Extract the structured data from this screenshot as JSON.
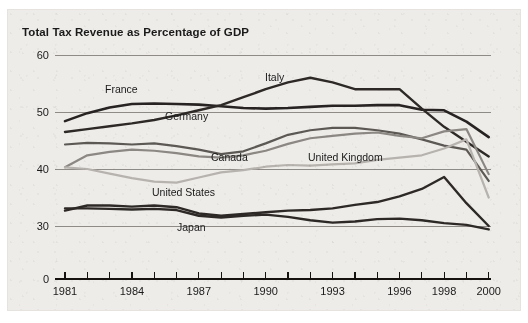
{
  "chart_data": {
    "type": "line",
    "title": "Total Tax Revenue as Percentage of GDP",
    "xlabel": "",
    "ylabel": "",
    "grid": true,
    "legend_position": "inline-labels",
    "axis_break": true,
    "ylim": [
      0,
      60
    ],
    "yticks": [
      0,
      30,
      40,
      50,
      60
    ],
    "ytick_labels": [
      "0",
      "30",
      "40",
      "50",
      "60"
    ],
    "xlim": [
      1981,
      2000
    ],
    "xticks": [
      1981,
      1982,
      1983,
      1984,
      1985,
      1986,
      1987,
      1988,
      1989,
      1990,
      1991,
      1992,
      1993,
      1994,
      1995,
      1996,
      1997,
      1998,
      1999,
      2000
    ],
    "xtick_labels_shown": [
      "1981",
      "1984",
      "1987",
      "1990",
      "1993",
      "1996",
      "1998",
      "2000"
    ],
    "x": [
      1981,
      1982,
      1983,
      1984,
      1985,
      1986,
      1987,
      1988,
      1989,
      1990,
      1991,
      1992,
      1993,
      1994,
      1995,
      1996,
      1997,
      1998,
      1999,
      2000
    ],
    "series": [
      {
        "name": "France",
        "color": "#262322",
        "width": 2.6,
        "values": [
          48.4,
          49.8,
          50.8,
          51.4,
          51.5,
          51.4,
          51.3,
          51.0,
          50.7,
          50.6,
          50.7,
          50.9,
          51.1,
          51.1,
          51.2,
          51.2,
          50.4,
          50.3,
          48.3,
          45.6
        ]
      },
      {
        "name": "Italy",
        "color": "#2c2927",
        "width": 2.4,
        "values": [
          46.5,
          47.0,
          47.5,
          48.0,
          48.6,
          49.4,
          50.3,
          51.2,
          52.6,
          54.0,
          55.2,
          56.0,
          55.2,
          54.0,
          54.0,
          54.0,
          50.6,
          47.4,
          44.8,
          42.2
        ]
      },
      {
        "name": "Germany",
        "color": "#5c5955",
        "width": 2.2,
        "values": [
          44.3,
          44.6,
          44.5,
          44.3,
          44.5,
          44.0,
          43.4,
          42.6,
          43.1,
          44.5,
          46.0,
          46.8,
          47.2,
          47.2,
          46.8,
          46.2,
          45.2,
          44.1,
          43.4,
          37.9
        ]
      },
      {
        "name": "United Kingdom",
        "color": "#8b8783",
        "width": 2.2,
        "values": [
          40.3,
          42.4,
          43.0,
          43.4,
          43.2,
          42.8,
          42.2,
          42.0,
          42.4,
          43.2,
          44.4,
          45.4,
          45.8,
          46.2,
          46.4,
          45.8,
          45.4,
          46.6,
          47.0,
          39.1
        ]
      },
      {
        "name": "Canada",
        "color": "#b6b2ae",
        "width": 2.2,
        "values": [
          40.3,
          40.0,
          39.2,
          38.4,
          37.8,
          37.6,
          38.5,
          39.4,
          39.8,
          40.4,
          40.7,
          40.6,
          40.8,
          41.0,
          41.6,
          42.0,
          42.4,
          43.6,
          45.2,
          35.0
        ]
      },
      {
        "name": "United States",
        "color": "#2c2927",
        "width": 2.4,
        "values": [
          32.7,
          33.6,
          33.6,
          33.4,
          33.6,
          33.3,
          32.2,
          31.8,
          32.1,
          32.4,
          32.7,
          32.8,
          33.1,
          33.7,
          34.2,
          35.2,
          36.5,
          38.6,
          34.0,
          30.0
        ]
      },
      {
        "name": "Japan",
        "color": "#2c2927",
        "width": 2.4,
        "values": [
          33.1,
          33.1,
          33.0,
          32.9,
          33.0,
          32.8,
          31.8,
          31.5,
          31.8,
          32.0,
          31.6,
          31.0,
          30.6,
          30.8,
          31.2,
          31.3,
          31.0,
          30.5,
          30.2,
          29.4
        ]
      }
    ],
    "annotations": [
      {
        "label": "France",
        "x_px": 105,
        "y_px": 93
      },
      {
        "label": "Italy",
        "x_px": 265,
        "y_px": 81
      },
      {
        "label": "Germany",
        "x_px": 165,
        "y_px": 120
      },
      {
        "label": "Canada",
        "x_px": 211,
        "y_px": 161
      },
      {
        "label": "United Kingdom",
        "x_px": 308,
        "y_px": 161
      },
      {
        "label": "United States",
        "x_px": 152,
        "y_px": 196
      },
      {
        "label": "Japan",
        "x_px": 177,
        "y_px": 231
      }
    ]
  },
  "geometry": {
    "x_1981_px": 65,
    "x_per_year_px": 22.3,
    "y_30_px": 226,
    "y_per_unit_px": 5.7,
    "y_zero_px": 279,
    "plot_right_px": 489
  }
}
